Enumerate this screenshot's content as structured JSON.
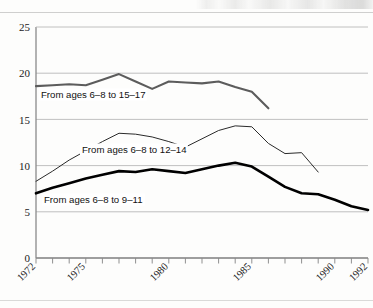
{
  "figure": {
    "kind": "line-chart",
    "background_color": "#fdfdfc"
  },
  "axes": {
    "y_ticks": [
      "0",
      "5",
      "10",
      "15",
      "20",
      "25"
    ],
    "x_ticks": [
      "1972",
      "1975",
      "1980",
      "1985",
      "1990",
      "1992"
    ]
  },
  "series_labels": {
    "top": "From ages 6–8 to 15–17",
    "middle": "From ages 6–8 to 12–14",
    "bottom": "From ages 6–8 to 9–11"
  },
  "colors": {
    "series_top": "#5c5c5c",
    "series_middle": "#2a2a2a",
    "series_bottom": "#000000",
    "grid": "#b9b9b9",
    "frame": "#8a8a8a",
    "text": "#1a1a1a"
  },
  "chart_data": {
    "type": "line",
    "title": "",
    "subtitle": "",
    "xlabel": "",
    "ylabel": "",
    "xlim": [
      1972,
      1992
    ],
    "ylim": [
      0,
      25
    ],
    "grid": true,
    "grid_axis": "y",
    "legend": "inline-labels",
    "legend_position": "inline",
    "x": [
      1972,
      1973,
      1974,
      1975,
      1976,
      1977,
      1978,
      1979,
      1980,
      1981,
      1982,
      1983,
      1984,
      1985,
      1986,
      1987,
      1988,
      1989,
      1990,
      1991,
      1992
    ],
    "x_tick_labels": [
      "1972",
      "1975",
      "1980",
      "1985",
      "1990",
      "1992"
    ],
    "x_tick_values": [
      1972,
      1975,
      1980,
      1985,
      1990,
      1992
    ],
    "y_tick_values": [
      0,
      5,
      10,
      15,
      20,
      25
    ],
    "series": [
      {
        "name": "From ages 6–8 to 15–17",
        "label": "From ages 6–8 to 15–17",
        "color": "#5c5c5c",
        "line_width": 2.1,
        "x": [
          1972,
          1973,
          1974,
          1975,
          1976,
          1977,
          1978,
          1979,
          1980,
          1981,
          1982,
          1983,
          1984,
          1985,
          1986
        ],
        "values": [
          18.6,
          18.7,
          18.8,
          18.7,
          19.3,
          19.9,
          19.1,
          18.3,
          19.1,
          19.0,
          18.9,
          19.1,
          18.5,
          18.0,
          16.2
        ]
      },
      {
        "name": "From ages 6–8 to 12–14",
        "label": "From ages 6–8 to 12–14",
        "color": "#2a2a2a",
        "line_width": 1.0,
        "x": [
          1972,
          1973,
          1974,
          1975,
          1976,
          1977,
          1978,
          1979,
          1980,
          1981,
          1982,
          1983,
          1984,
          1985,
          1986,
          1987,
          1988,
          1989
        ],
        "values": [
          8.3,
          9.4,
          10.6,
          11.6,
          12.6,
          13.5,
          13.4,
          13.1,
          12.6,
          12.0,
          12.9,
          13.8,
          14.3,
          14.2,
          12.4,
          11.3,
          11.4,
          9.3
        ]
      },
      {
        "name": "From ages 6–8 to 9–11",
        "label": "From ages 6–8 to 9–11",
        "color": "#000000",
        "line_width": 2.6,
        "x": [
          1972,
          1973,
          1974,
          1975,
          1976,
          1977,
          1978,
          1979,
          1980,
          1981,
          1982,
          1983,
          1984,
          1985,
          1986,
          1987,
          1988,
          1989,
          1990,
          1991,
          1992
        ],
        "values": [
          7.0,
          7.6,
          8.1,
          8.6,
          9.0,
          9.4,
          9.3,
          9.6,
          9.4,
          9.2,
          9.6,
          10.0,
          10.3,
          9.9,
          8.8,
          7.7,
          7.0,
          6.9,
          6.3,
          5.6,
          5.2
        ]
      }
    ]
  }
}
